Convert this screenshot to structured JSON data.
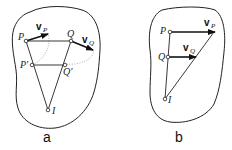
{
  "figures": [
    {
      "id": "a",
      "caption": "a",
      "points": {
        "P": "P",
        "Q": "Q",
        "P_prime": "P'",
        "Q_prime": "Q'",
        "I": "I"
      },
      "vectors": {
        "vP": {
          "symbol": "v",
          "sub": "P"
        },
        "vQ": {
          "symbol": "v",
          "sub": "Q"
        }
      }
    },
    {
      "id": "b",
      "caption": "b",
      "points": {
        "P": "P",
        "Q": "Q",
        "I": "I"
      },
      "vectors": {
        "vP": {
          "symbol": "v",
          "sub": "P"
        },
        "vQ": {
          "symbol": "v",
          "sub": "Q"
        }
      }
    }
  ],
  "colors": {
    "stroke": "#222222",
    "background": "#ffffff"
  }
}
